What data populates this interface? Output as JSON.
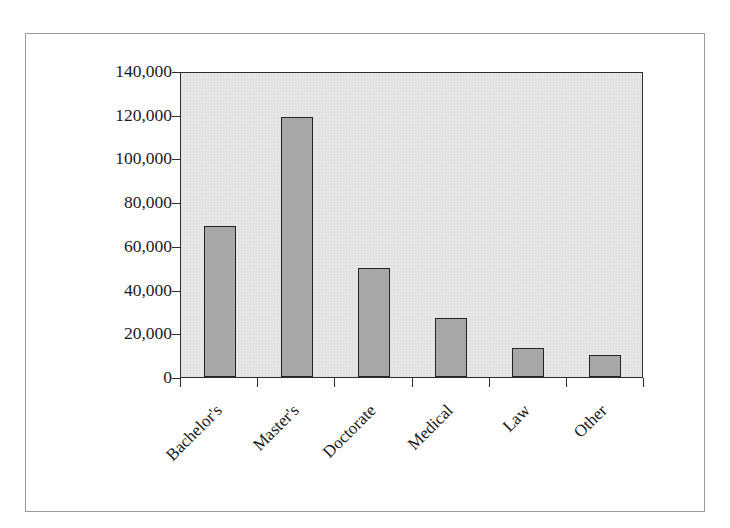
{
  "chart_data": {
    "type": "bar",
    "title": "",
    "subtitle": "",
    "xlabel": "",
    "ylabel": "",
    "categories": [
      "Bachelor's",
      "Master's",
      "Doctorate",
      "Medical",
      "Law",
      "Other"
    ],
    "values": [
      69000,
      119000,
      50000,
      27000,
      13500,
      10000
    ],
    "series": [
      {
        "name": "",
        "values": [
          69000,
          119000,
          50000,
          27000,
          13500,
          10000
        ]
      }
    ],
    "ylim": [
      0,
      140000
    ],
    "ytick_values": [
      0,
      20000,
      40000,
      60000,
      80000,
      100000,
      120000,
      140000
    ],
    "ytick_labels": [
      "0",
      "20,000",
      "40,000",
      "60,000",
      "80,000",
      "100,000",
      "120,000",
      "140,000"
    ],
    "grid": false,
    "legend": false,
    "legend_position": "none",
    "xtick_label_rotation": -45,
    "colors": {
      "bar_fill": "#a7a7a7",
      "bar_border": "#232323",
      "plot_background": "#e7e7e7",
      "axis": "#2e2e2e",
      "text": "#1a1a1a",
      "figure_border": "#9a9a9a",
      "figure_background": "#ffffff"
    }
  }
}
